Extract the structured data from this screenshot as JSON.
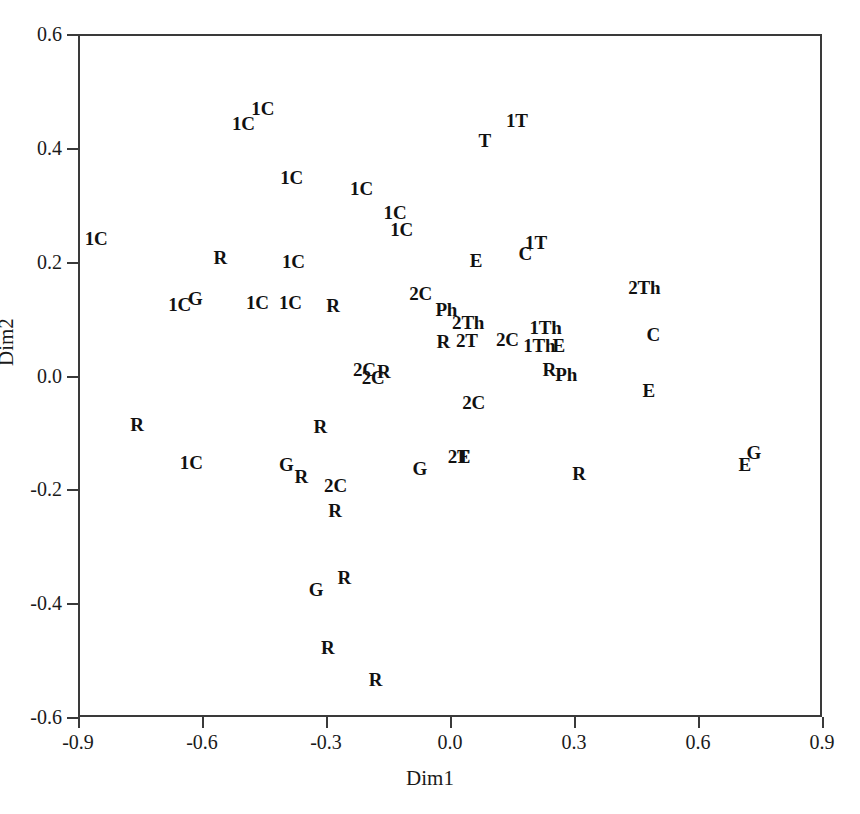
{
  "chart_data": {
    "type": "scatter",
    "title": "",
    "subtitle": "",
    "xlabel": "Dim1",
    "ylabel": "Dim2",
    "xlim": [
      -0.9,
      0.9
    ],
    "ylim": [
      -0.6,
      0.6
    ],
    "xticks": [
      "-0.9",
      "-0.6",
      "-0.3",
      "0.0",
      "0.3",
      "0.6",
      "0.9"
    ],
    "xtick_values": [
      -0.9,
      -0.6,
      -0.3,
      0.0,
      0.3,
      0.6,
      0.9
    ],
    "yticks": [
      "0.6",
      "0.4",
      "0.2",
      "0.0",
      "-0.2",
      "-0.4",
      "-0.6"
    ],
    "ytick_values": [
      0.6,
      0.4,
      0.2,
      0.0,
      -0.2,
      -0.4,
      -0.6
    ],
    "grid": false,
    "legend": "none",
    "marker_style": "text-label",
    "point_label_categories": [
      "1C",
      "2C",
      "1T",
      "2T",
      "1Th",
      "2Th",
      "R",
      "G",
      "C",
      "T",
      "E",
      "Ph"
    ],
    "points": [
      {
        "label": "1C",
        "x": -0.453,
        "y": 0.47
      },
      {
        "label": "1C",
        "x": -0.5,
        "y": 0.443
      },
      {
        "label": "1T",
        "x": 0.162,
        "y": 0.449
      },
      {
        "label": "T",
        "x": 0.084,
        "y": 0.414
      },
      {
        "label": "1C",
        "x": -0.383,
        "y": 0.349
      },
      {
        "label": "1C",
        "x": -0.214,
        "y": 0.33
      },
      {
        "label": "1C",
        "x": -0.133,
        "y": 0.288
      },
      {
        "label": "1C",
        "x": -0.117,
        "y": 0.257
      },
      {
        "label": "1C",
        "x": -0.856,
        "y": 0.242
      },
      {
        "label": "1T",
        "x": 0.208,
        "y": 0.234
      },
      {
        "label": "C",
        "x": 0.182,
        "y": 0.215
      },
      {
        "label": "R",
        "x": -0.556,
        "y": 0.208
      },
      {
        "label": "1C",
        "x": -0.379,
        "y": 0.201
      },
      {
        "label": "E",
        "x": 0.063,
        "y": 0.203
      },
      {
        "label": "2Th",
        "x": 0.47,
        "y": 0.156
      },
      {
        "label": "2C",
        "x": -0.071,
        "y": 0.145
      },
      {
        "label": "1C",
        "x": -0.654,
        "y": 0.126
      },
      {
        "label": "G",
        "x": -0.616,
        "y": 0.136
      },
      {
        "label": "1C",
        "x": -0.466,
        "y": 0.13
      },
      {
        "label": "1C",
        "x": -0.386,
        "y": 0.129
      },
      {
        "label": "R",
        "x": -0.283,
        "y": 0.123
      },
      {
        "label": "Ph",
        "x": -0.009,
        "y": 0.117
      },
      {
        "label": "2Th",
        "x": 0.044,
        "y": 0.094
      },
      {
        "label": "1Th",
        "x": 0.231,
        "y": 0.085
      },
      {
        "label": "C",
        "x": 0.492,
        "y": 0.073
      },
      {
        "label": "R",
        "x": -0.016,
        "y": 0.061
      },
      {
        "label": "2T",
        "x": 0.041,
        "y": 0.063
      },
      {
        "label": "2C",
        "x": 0.139,
        "y": 0.064
      },
      {
        "label": "1Th",
        "x": 0.216,
        "y": 0.054
      },
      {
        "label": "E",
        "x": 0.263,
        "y": 0.054
      },
      {
        "label": "2C",
        "x": -0.207,
        "y": 0.012
      },
      {
        "label": "2C",
        "x": -0.186,
        "y": -0.003
      },
      {
        "label": "R",
        "x": -0.16,
        "y": 0.008
      },
      {
        "label": "R",
        "x": 0.24,
        "y": 0.011
      },
      {
        "label": "Ph",
        "x": 0.281,
        "y": 0.003
      },
      {
        "label": "E",
        "x": 0.481,
        "y": -0.026
      },
      {
        "label": "2C",
        "x": 0.057,
        "y": -0.047
      },
      {
        "label": "R",
        "x": -0.757,
        "y": -0.085
      },
      {
        "label": "R",
        "x": -0.314,
        "y": -0.088
      },
      {
        "label": "G",
        "x": 0.735,
        "y": -0.134
      },
      {
        "label": "E",
        "x": 0.034,
        "y": -0.141
      },
      {
        "label": "2T",
        "x": 0.021,
        "y": -0.141
      },
      {
        "label": "1C",
        "x": -0.626,
        "y": -0.152
      },
      {
        "label": "G",
        "x": -0.396,
        "y": -0.155
      },
      {
        "label": "G",
        "x": -0.073,
        "y": -0.163
      },
      {
        "label": "R",
        "x": -0.36,
        "y": -0.176
      },
      {
        "label": "R",
        "x": 0.312,
        "y": -0.172
      },
      {
        "label": "E",
        "x": 0.713,
        "y": -0.155
      },
      {
        "label": "2C",
        "x": -0.277,
        "y": -0.193
      },
      {
        "label": "R",
        "x": -0.278,
        "y": -0.237
      },
      {
        "label": "R",
        "x": -0.256,
        "y": -0.354
      },
      {
        "label": "G",
        "x": -0.324,
        "y": -0.375
      },
      {
        "label": "R",
        "x": -0.296,
        "y": -0.477
      },
      {
        "label": "R",
        "x": -0.18,
        "y": -0.533
      }
    ]
  }
}
